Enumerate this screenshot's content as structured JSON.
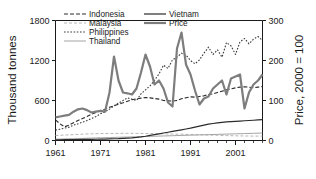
{
  "chart_data": {
    "type": "line",
    "title": "",
    "xlabel": "",
    "ylabel": "Thousand tonnes",
    "y2label": "Price, 2000 = 100",
    "xlim": [
      1961,
      2007
    ],
    "ylim": [
      0,
      1800
    ],
    "y2lim": [
      0,
      300
    ],
    "grid": false,
    "legend_position": "top-inside",
    "x_ticks": [
      "1961",
      "1971",
      "1981",
      "1991",
      "2001"
    ],
    "x_tick_values": [
      1961,
      1971,
      1981,
      1991,
      2001
    ],
    "x_minor_step": 2,
    "y_ticks": [
      "0",
      "600",
      "1200",
      "1800"
    ],
    "y_tick_values": [
      0,
      600,
      1200,
      1800
    ],
    "y2_ticks": [
      "0",
      "100",
      "200",
      "300"
    ],
    "y2_tick_values": [
      0,
      100,
      200,
      300
    ],
    "years": [
      1961,
      1962,
      1963,
      1964,
      1965,
      1966,
      1967,
      1968,
      1969,
      1970,
      1971,
      1972,
      1973,
      1974,
      1975,
      1976,
      1977,
      1978,
      1979,
      1980,
      1981,
      1982,
      1983,
      1984,
      1985,
      1986,
      1987,
      1988,
      1989,
      1990,
      1991,
      1992,
      1993,
      1994,
      1995,
      1996,
      1997,
      1998,
      1999,
      2000,
      2001,
      2002,
      2003,
      2004,
      2005,
      2006,
      2007
    ],
    "series": [
      {
        "name": "Indonesia",
        "axis": "left",
        "style": "dashed",
        "color": "#2b2b2b",
        "width": 1.1,
        "dash": "4,2",
        "values": [
          310,
          250,
          205,
          230,
          265,
          300,
          330,
          360,
          395,
          420,
          450,
          470,
          500,
          520,
          545,
          565,
          590,
          610,
          625,
          635,
          645,
          640,
          630,
          620,
          600,
          595,
          590,
          600,
          625,
          640,
          655,
          650,
          660,
          670,
          690,
          700,
          720,
          740,
          760,
          775,
          790,
          800,
          805,
          800,
          790,
          800,
          810
        ]
      },
      {
        "name": "Malaysia",
        "axis": "left",
        "style": "dashed",
        "color": "#b5b5b5",
        "width": 1.0,
        "dash": "3,2",
        "values": [
          75,
          78,
          82,
          85,
          88,
          92,
          95,
          98,
          100,
          102,
          104,
          105,
          106,
          106,
          107,
          108,
          108,
          108,
          107,
          106,
          105,
          104,
          103,
          101,
          100,
          98,
          97,
          95,
          94,
          92,
          90,
          88,
          86,
          84,
          82,
          80,
          78,
          76,
          74,
          72,
          70,
          69,
          68,
          67,
          66,
          66,
          66
        ]
      },
      {
        "name": "Philippines",
        "axis": "left",
        "style": "dotted",
        "color": "#3a3a3a",
        "width": 1.1,
        "dash": "1.6,1.6",
        "values": [
          155,
          170,
          185,
          200,
          230,
          250,
          275,
          300,
          330,
          360,
          400,
          430,
          470,
          520,
          560,
          600,
          640,
          620,
          600,
          700,
          760,
          820,
          900,
          1000,
          1130,
          1080,
          1210,
          1250,
          1310,
          1280,
          1200,
          1150,
          1210,
          1310,
          1400,
          1290,
          1360,
          1250,
          1470,
          1420,
          1290,
          1480,
          1530,
          1450,
          1520,
          1560,
          1500
        ]
      },
      {
        "name": "Thailand",
        "axis": "left",
        "style": "solid",
        "color": "#9a9a9a",
        "width": 0.9,
        "dash": "",
        "values": [
          20,
          22,
          24,
          26,
          28,
          30,
          32,
          34,
          36,
          38,
          40,
          42,
          44,
          46,
          48,
          50,
          52,
          54,
          56,
          58,
          60,
          62,
          64,
          66,
          68,
          70,
          72,
          74,
          76,
          78,
          80,
          82,
          84,
          86,
          88,
          90,
          92,
          94,
          96,
          98,
          100,
          102,
          104,
          106,
          108,
          110,
          112
        ]
      },
      {
        "name": "Vietnam",
        "axis": "left",
        "style": "solid",
        "color": "#2b2b2b",
        "width": 1.2,
        "dash": "",
        "values": [
          10,
          11,
          12,
          13,
          14,
          15,
          16,
          17,
          18,
          19,
          20,
          22,
          24,
          26,
          28,
          32,
          36,
          40,
          46,
          54,
          64,
          76,
          88,
          100,
          112,
          124,
          136,
          148,
          160,
          172,
          185,
          200,
          215,
          230,
          245,
          255,
          265,
          272,
          278,
          283,
          288,
          292,
          296,
          300,
          304,
          308,
          312
        ]
      },
      {
        "name": "Price",
        "axis": "right",
        "style": "solid",
        "color": "#7d7d7d",
        "width": 2.2,
        "dash": "",
        "values": [
          58,
          60,
          62,
          64,
          72,
          78,
          80,
          76,
          70,
          72,
          74,
          72,
          120,
          210,
          150,
          120,
          118,
          115,
          130,
          170,
          215,
          185,
          140,
          150,
          130,
          95,
          85,
          230,
          270,
          190,
          165,
          125,
          90,
          105,
          110,
          130,
          140,
          150,
          115,
          155,
          160,
          165,
          80,
          120,
          140,
          150,
          165,
          215,
          285
        ]
      }
    ],
    "legend": [
      {
        "label": "Indonesia",
        "style": "dashed",
        "color": "#2b2b2b",
        "dash": "4,2",
        "width": 1.1
      },
      {
        "label": "Malaysia",
        "style": "dashed",
        "color": "#b5b5b5",
        "dash": "3,2",
        "width": 1.0
      },
      {
        "label": "Philippines",
        "style": "dotted",
        "color": "#3a3a3a",
        "dash": "1.6,1.6",
        "width": 1.1
      },
      {
        "label": "Thailand",
        "style": "solid",
        "color": "#9a9a9a",
        "dash": "",
        "width": 0.9
      },
      {
        "label": "Vietnam",
        "style": "solid",
        "color": "#2b2b2b",
        "dash": "",
        "width": 1.2
      },
      {
        "label": "Price",
        "style": "solid",
        "color": "#7d7d7d",
        "dash": "",
        "width": 2.2
      }
    ]
  },
  "axes": {
    "left_title": "Thousand tonnes",
    "right_title": "Price, 2000 = 100"
  },
  "colors": {
    "axis": "#1a1a1a",
    "text": "#1a1a1a",
    "background": "#ffffff"
  }
}
